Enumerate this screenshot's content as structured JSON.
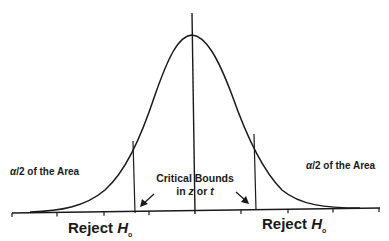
{
  "diagram": {
    "type": "two-tailed normal distribution with rejection regions",
    "left_tail_label": {
      "alpha": "α",
      "rest": "/2 of the Area"
    },
    "right_tail_label": {
      "alpha": "α",
      "rest": "/2 of the Area"
    },
    "critical_bounds": {
      "line1": "Critical Bounds",
      "line2_prefix": "in ",
      "line2_z": "z",
      "line2_mid": " or ",
      "line2_t": "t"
    },
    "left_reject": {
      "word": "Reject ",
      "h": "H",
      "sub": "o"
    },
    "right_reject": {
      "word": "Reject ",
      "h": "H",
      "sub": "o"
    },
    "colors": {
      "line": "#1a1a1a",
      "background": "#ffffff"
    }
  }
}
